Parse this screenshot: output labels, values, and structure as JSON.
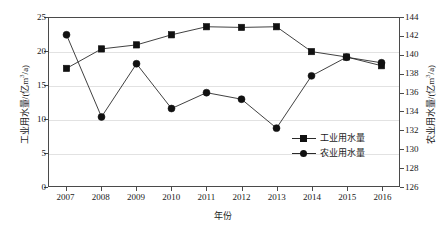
{
  "chart_data": {
    "type": "line",
    "title": "",
    "xlabel": "年份",
    "categories": [
      "2007",
      "2008",
      "2009",
      "2010",
      "2011",
      "2012",
      "2013",
      "2014",
      "2015",
      "2016"
    ],
    "grid": true,
    "legend_position": "inside-right",
    "axes": {
      "x": {
        "label": "年份",
        "ticks": [
          "2007",
          "2008",
          "2009",
          "2010",
          "2011",
          "2012",
          "2013",
          "2014",
          "2015",
          "2016"
        ]
      },
      "y_left": {
        "label": "工业用水量/(亿m3/a)",
        "label_main": "工业用水量/(亿m",
        "label_sup": "3",
        "label_tail": "/a)",
        "ylim": [
          0,
          25
        ],
        "step": 5,
        "ticks": [
          "0",
          "5",
          "10",
          "15",
          "20",
          "25"
        ]
      },
      "y_right": {
        "label": "农业用水量/(亿m3/a)",
        "label_main": "农业用水量/(亿m",
        "label_sup": "3",
        "label_tail": "/a)",
        "ylim": [
          126,
          144
        ],
        "step": 2,
        "ticks": [
          "126",
          "128",
          "130",
          "132",
          "134",
          "136",
          "138",
          "140",
          "142",
          "144"
        ]
      }
    },
    "series": [
      {
        "name": "工业用水量",
        "axis": "left",
        "marker": "square",
        "color": "#111111",
        "values": [
          17.5,
          20.4,
          21.0,
          22.5,
          23.7,
          23.6,
          23.7,
          20.0,
          19.2,
          17.9
        ]
      },
      {
        "name": "农业用水量",
        "axis": "right",
        "marker": "circle",
        "color": "#111111",
        "values": [
          142.2,
          133.4,
          139.1,
          134.3,
          136.0,
          135.3,
          132.2,
          137.8,
          139.8,
          139.2
        ]
      }
    ]
  },
  "legend": {
    "items": [
      {
        "label": "工业用水量",
        "marker": "square"
      },
      {
        "label": "农业用水量",
        "marker": "circle"
      }
    ]
  }
}
